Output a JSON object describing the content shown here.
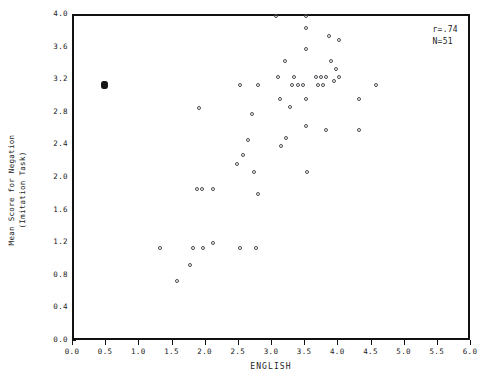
{
  "chart_data": {
    "type": "scatter",
    "title": "",
    "xlabel": "ENGLISH",
    "ylabel": "Mean Score for Negation\n(Imitation Task)",
    "ylabel_line1": "Mean Score for Negation",
    "ylabel_line2": "(Imitation Task)",
    "xlim": [
      0.0,
      6.0
    ],
    "ylim": [
      0.0,
      4.0
    ],
    "xticks": [
      "0.0",
      "0.5",
      "1.0",
      "1.5",
      "2.0",
      "2.5",
      "3.0",
      "3.5",
      "4.0",
      "4.5",
      "5.0",
      "5.5",
      "6.0"
    ],
    "xtick_values": [
      0.0,
      0.5,
      1.0,
      1.5,
      2.0,
      2.5,
      3.0,
      3.5,
      4.0,
      4.5,
      5.0,
      5.5,
      6.0
    ],
    "yticks": [
      "0.0",
      "0.4",
      "0.8",
      "1.2",
      "1.6",
      "2.0",
      "2.4",
      "2.8",
      "3.2",
      "3.6",
      "4.0"
    ],
    "ytick_values": [
      0.0,
      0.4,
      0.8,
      1.2,
      1.6,
      2.0,
      2.4,
      2.8,
      3.2,
      3.6,
      4.0
    ],
    "grid": false,
    "legend": false,
    "marker": "open-circle",
    "annotations": [
      {
        "name": "correlation",
        "text": "r=.74"
      },
      {
        "name": "sample-size",
        "text": "N=51"
      }
    ],
    "annotation_position": "top-right",
    "points": [
      {
        "x": 0.45,
        "y": 3.15,
        "style": "blob"
      },
      {
        "x": 1.3,
        "y": 1.15
      },
      {
        "x": 1.55,
        "y": 0.75
      },
      {
        "x": 1.75,
        "y": 0.95
      },
      {
        "x": 1.8,
        "y": 1.15
      },
      {
        "x": 1.88,
        "y": 2.87
      },
      {
        "x": 1.85,
        "y": 1.88
      },
      {
        "x": 1.93,
        "y": 1.88
      },
      {
        "x": 1.95,
        "y": 1.15
      },
      {
        "x": 2.1,
        "y": 1.22
      },
      {
        "x": 2.1,
        "y": 1.88
      },
      {
        "x": 2.45,
        "y": 2.18
      },
      {
        "x": 2.5,
        "y": 1.15
      },
      {
        "x": 2.5,
        "y": 3.15
      },
      {
        "x": 2.55,
        "y": 2.3
      },
      {
        "x": 2.62,
        "y": 2.48
      },
      {
        "x": 2.68,
        "y": 2.8
      },
      {
        "x": 2.72,
        "y": 2.08
      },
      {
        "x": 2.75,
        "y": 1.15
      },
      {
        "x": 2.78,
        "y": 1.82
      },
      {
        "x": 2.78,
        "y": 3.15
      },
      {
        "x": 3.05,
        "y": 4.0
      },
      {
        "x": 3.08,
        "y": 3.25
      },
      {
        "x": 3.1,
        "y": 2.98
      },
      {
        "x": 3.12,
        "y": 2.4
      },
      {
        "x": 3.18,
        "y": 3.45
      },
      {
        "x": 3.2,
        "y": 2.5
      },
      {
        "x": 3.25,
        "y": 2.88
      },
      {
        "x": 3.28,
        "y": 3.15
      },
      {
        "x": 3.32,
        "y": 3.25
      },
      {
        "x": 3.38,
        "y": 3.15
      },
      {
        "x": 3.45,
        "y": 3.15
      },
      {
        "x": 3.5,
        "y": 4.0
      },
      {
        "x": 3.5,
        "y": 3.85
      },
      {
        "x": 3.5,
        "y": 3.6
      },
      {
        "x": 3.5,
        "y": 2.98
      },
      {
        "x": 3.5,
        "y": 2.65
      },
      {
        "x": 3.52,
        "y": 2.08
      },
      {
        "x": 3.65,
        "y": 3.25
      },
      {
        "x": 3.68,
        "y": 3.15
      },
      {
        "x": 3.72,
        "y": 3.25
      },
      {
        "x": 3.75,
        "y": 3.15
      },
      {
        "x": 3.8,
        "y": 3.25
      },
      {
        "x": 3.8,
        "y": 2.6
      },
      {
        "x": 3.85,
        "y": 3.75
      },
      {
        "x": 3.88,
        "y": 3.45
      },
      {
        "x": 3.92,
        "y": 3.2
      },
      {
        "x": 3.95,
        "y": 3.35
      },
      {
        "x": 4.0,
        "y": 3.7
      },
      {
        "x": 4.0,
        "y": 3.25
      },
      {
        "x": 4.3,
        "y": 2.98
      },
      {
        "x": 4.3,
        "y": 2.6
      },
      {
        "x": 4.55,
        "y": 3.15
      }
    ]
  }
}
